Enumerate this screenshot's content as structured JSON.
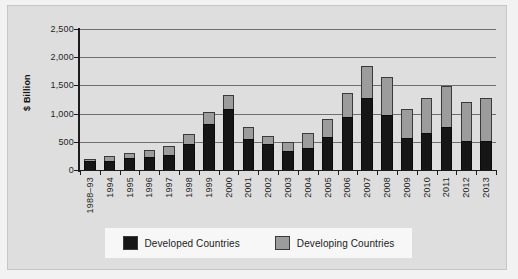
{
  "chart_data": {
    "type": "bar",
    "stacked": true,
    "title": "",
    "xlabel": "",
    "ylabel": "$ Billion",
    "ylim": [
      0,
      2500
    ],
    "ytick_values": [
      0,
      500,
      1000,
      1500,
      2000,
      2500
    ],
    "ytick_labels": [
      "0",
      "500",
      "1,000",
      "1,500",
      "2,000",
      "2,500"
    ],
    "grid": true,
    "legend_position": "bottom",
    "categories": [
      "1988–93",
      "1994",
      "1995",
      "1996",
      "1997",
      "1998",
      "1999",
      "2000",
      "2001",
      "2002",
      "2003",
      "2004",
      "2005",
      "2006",
      "2007",
      "2008",
      "2009",
      "2010",
      "2011",
      "2012",
      "2013"
    ],
    "series": [
      {
        "name": "Developed Countries",
        "color": "#161616",
        "values": [
          160,
          165,
          210,
          230,
          270,
          460,
          810,
          1080,
          550,
          470,
          330,
          390,
          590,
          940,
          1270,
          980,
          570,
          650,
          770,
          510,
          520
        ]
      },
      {
        "name": "Developing Countries",
        "color": "#9c9c9c",
        "values": [
          40,
          80,
          95,
          130,
          160,
          180,
          220,
          250,
          210,
          140,
          165,
          275,
          320,
          430,
          580,
          670,
          520,
          630,
          725,
          700,
          760
        ]
      }
    ],
    "totals": [
      200,
      245,
      305,
      360,
      430,
      640,
      1030,
      1330,
      760,
      610,
      495,
      665,
      910,
      1370,
      1850,
      1650,
      1090,
      1280,
      1495,
      1210,
      1280
    ]
  },
  "legend": {
    "entries": [
      {
        "label": "Developed Countries",
        "swatch": "black-swatch-icon"
      },
      {
        "label": "Developing Countries",
        "swatch": "gray-swatch-icon"
      }
    ]
  },
  "colors": {
    "page_background": "#f2f2f2",
    "figure_background": "#dedede",
    "legend_background": "#f7f7f7",
    "gridline": "#6f6f6f",
    "axis": "#1c1c1c",
    "developed": "#161616",
    "developing": "#9c9c9c"
  }
}
